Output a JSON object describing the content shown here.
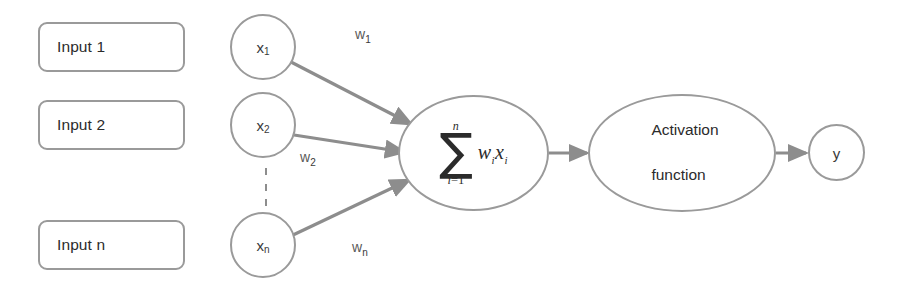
{
  "diagram": {
    "stroke_color": "#9a9a9a",
    "text_color": "#2b2b2b",
    "background": "#ffffff"
  },
  "inputs": [
    {
      "label": "Input 1"
    },
    {
      "label": "Input 2"
    },
    {
      "label": "Input n"
    }
  ],
  "nodes": [
    {
      "label": "x",
      "sub": "1"
    },
    {
      "label": "x",
      "sub": "2"
    },
    {
      "label": "x",
      "sub": "n"
    }
  ],
  "weights": [
    {
      "label": "w",
      "sub": "1"
    },
    {
      "label": "w",
      "sub": "2"
    },
    {
      "label": "w",
      "sub": "n"
    }
  ],
  "summation": {
    "sigma": "∑",
    "upper_limit": "n",
    "lower_limit_var": "i",
    "lower_limit_eq": "=1",
    "body_w": "w",
    "body_w_sub": "i",
    "body_x": "x",
    "body_x_sub": "i",
    "full_expression": "∑ i=1 to n of wᵢxᵢ"
  },
  "activation": {
    "line1": "Activation",
    "line2": "function"
  },
  "output": {
    "label": "y"
  },
  "ellipsis": {
    "symbol": "vertical-dots",
    "count": 3
  }
}
